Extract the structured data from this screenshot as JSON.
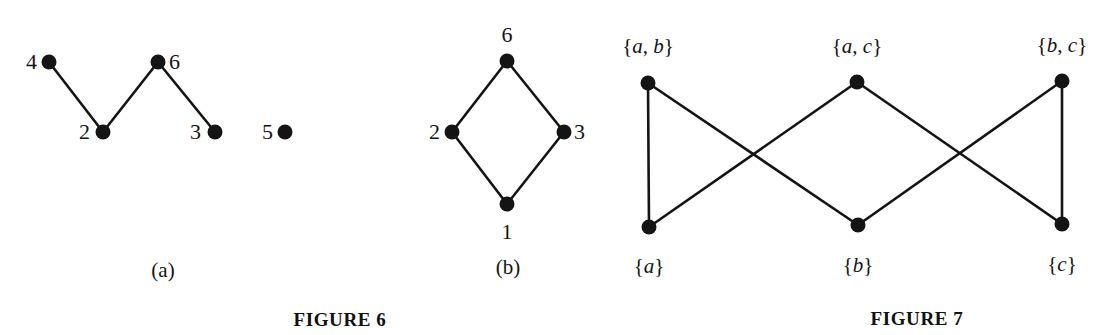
{
  "page": {
    "background": "#ffffff",
    "ink": "#141414",
    "width": 1116,
    "height": 335
  },
  "figure6": {
    "title": "FIGURE 6",
    "panels": [
      {
        "caption": "(a)",
        "description": "Graph on vertices 2, 3, 4, 5, 6 drawn as a zig-zag path with an isolated vertex",
        "vertices": [
          {
            "id": "4",
            "label": "4",
            "x": 49,
            "y": 62,
            "label_x": 32,
            "label_y": 62
          },
          {
            "id": "2",
            "label": "2",
            "x": 103,
            "y": 132,
            "label_x": 86,
            "label_y": 132
          },
          {
            "id": "6",
            "label": "6",
            "x": 158,
            "y": 62,
            "label_x": 176,
            "label_y": 62
          },
          {
            "id": "3",
            "label": "3",
            "x": 215,
            "y": 132,
            "label_x": 196,
            "label_y": 132
          },
          {
            "id": "5",
            "label": "5",
            "x": 285,
            "y": 132,
            "label_x": 268,
            "label_y": 132
          }
        ],
        "edges": [
          {
            "from": "4",
            "to": "2"
          },
          {
            "from": "2",
            "to": "6"
          },
          {
            "from": "6",
            "to": "3"
          }
        ]
      },
      {
        "caption": "(b)",
        "description": "Four-cycle on vertices 1, 2, 3, 6 drawn as a diamond",
        "vertices": [
          {
            "id": "6",
            "label": "6",
            "x": 507,
            "y": 61,
            "label_x": 507,
            "label_y": 34
          },
          {
            "id": "2",
            "label": "2",
            "x": 452,
            "y": 132,
            "label_x": 436,
            "label_y": 132
          },
          {
            "id": "3",
            "label": "3",
            "x": 564,
            "y": 132,
            "label_x": 580,
            "label_y": 132
          },
          {
            "id": "1",
            "label": "1",
            "x": 507,
            "y": 204,
            "label_x": 507,
            "label_y": 231
          }
        ],
        "edges": [
          {
            "from": "6",
            "to": "2"
          },
          {
            "from": "6",
            "to": "3"
          },
          {
            "from": "2",
            "to": "1"
          },
          {
            "from": "3",
            "to": "1"
          }
        ]
      }
    ]
  },
  "figure7": {
    "title": "FIGURE 7",
    "description": "Bipartite Hasse-style diagram of two-element subsets above one-element subsets of {a, b, c}",
    "top_vertices": [
      {
        "id": "ab",
        "label": "{a, b}",
        "elements": "a, b",
        "x": 648,
        "y": 83,
        "label_x": 648,
        "label_y": 47
      },
      {
        "id": "ac",
        "label": "{a, c}",
        "elements": "a, c",
        "x": 857,
        "y": 82,
        "label_x": 857,
        "label_y": 47
      },
      {
        "id": "bc",
        "label": "{b, c}",
        "elements": "b, c",
        "x": 1062,
        "y": 81,
        "label_x": 1062,
        "label_y": 46
      }
    ],
    "bottom_vertices": [
      {
        "id": "a",
        "label": "{a}",
        "elements": "a",
        "x": 649,
        "y": 227,
        "label_x": 649,
        "label_y": 267
      },
      {
        "id": "b",
        "label": "{b}",
        "elements": "b",
        "x": 858,
        "y": 225,
        "label_x": 858,
        "label_y": 266
      },
      {
        "id": "c",
        "label": "{c}",
        "elements": "c",
        "x": 1062,
        "y": 224,
        "label_x": 1062,
        "label_y": 265
      }
    ],
    "edges": [
      {
        "from": "ab",
        "to": "a"
      },
      {
        "from": "ab",
        "to": "b"
      },
      {
        "from": "ac",
        "to": "a"
      },
      {
        "from": "ac",
        "to": "c"
      },
      {
        "from": "bc",
        "to": "b"
      },
      {
        "from": "bc",
        "to": "c"
      }
    ]
  },
  "titles": [
    {
      "id": "figure6-title",
      "text": "FIGURE 6",
      "x": 340,
      "y": 319
    },
    {
      "id": "figure7-title",
      "text": "FIGURE 7",
      "x": 917,
      "y": 318
    }
  ],
  "captions": [
    {
      "id": "panel-a-caption",
      "text": "(a)",
      "x": 163,
      "y": 271
    },
    {
      "id": "panel-b-caption",
      "text": "(b)",
      "x": 508,
      "y": 268
    }
  ],
  "style": {
    "vertex_radius": 7.5,
    "edge_width": 2.6
  }
}
